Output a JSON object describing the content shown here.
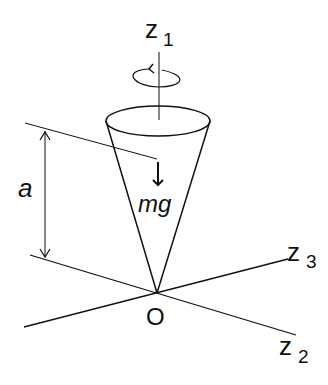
{
  "diagram": {
    "labels": {
      "z1": "z",
      "z1_sub": "1",
      "z2": "z",
      "z2_sub": "2",
      "z3": "z",
      "z3_sub": "3",
      "origin": "O",
      "height": "a",
      "weight": "mg"
    },
    "colors": {
      "stroke": "#111111",
      "background": "#ffffff"
    }
  }
}
